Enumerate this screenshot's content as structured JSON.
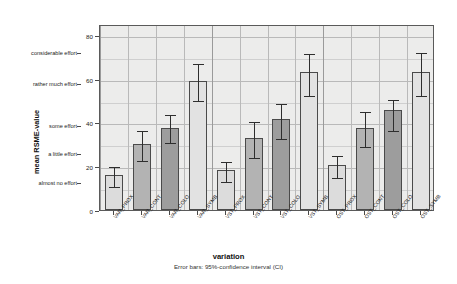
{
  "chart_data": {
    "type": "bar",
    "title": "",
    "xlabel": "variation",
    "ylabel": "mean RSME-value",
    "footnote": "Error bars: 95%-confidence interval (CI)",
    "ylim": [
      0,
      85
    ],
    "grid": true,
    "legend": "none",
    "y_numeric_ticks": [
      {
        "value": 0,
        "label": "0"
      },
      {
        "value": 20,
        "label": "20"
      },
      {
        "value": 40,
        "label": "40"
      },
      {
        "value": 60,
        "label": "60"
      },
      {
        "value": 80,
        "label": "80"
      }
    ],
    "y_category_labels": [
      {
        "value": 13,
        "label": "almost no effort"
      },
      {
        "value": 26,
        "label": "a little effort"
      },
      {
        "value": 39,
        "label": "some effort"
      },
      {
        "value": 58,
        "label": "rather much effort"
      },
      {
        "value": 72,
        "label": "considerable effort"
      }
    ],
    "categories": [
      "VAR_PROX",
      "VAR_CONT",
      "VAR_COLO",
      "VAR_SYMB",
      "VST_PROX",
      "VST_CONT",
      "VST_COLO",
      "VST_SYMB",
      "OST_PROX",
      "OST_CONT",
      "OST_COLO",
      "OST_SYMB"
    ],
    "values": [
      16.0,
      30.0,
      37.5,
      59.0,
      18.5,
      33.0,
      41.5,
      63.0,
      20.5,
      37.5,
      45.5,
      63.0
    ],
    "ci_lower": [
      11.5,
      23.5,
      31.5,
      50.5,
      13.5,
      24.5,
      33.5,
      53.0,
      15.5,
      29.5,
      37.0,
      53.0
    ],
    "ci_upper": [
      20.5,
      37.0,
      44.5,
      67.5,
      23.0,
      41.0,
      49.5,
      72.0,
      25.5,
      45.5,
      51.0,
      72.5
    ],
    "bar_shades": [
      "#dcdcdc",
      "#b3b3b3",
      "#9d9d9d",
      "#e2e2e2",
      "#dcdcdc",
      "#b3b3b3",
      "#9d9d9d",
      "#e2e2e2",
      "#dcdcdc",
      "#b3b3b3",
      "#9d9d9d",
      "#e2e2e2"
    ],
    "plot_background": "#ececeb",
    "grid_color": "#b9b9b9",
    "axis_color": "#5a5a5a",
    "error_bar_color": "#2e2e2e"
  }
}
